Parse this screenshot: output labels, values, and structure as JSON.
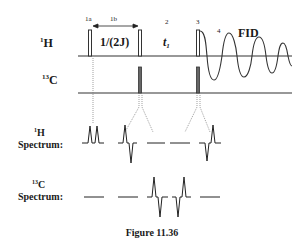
{
  "figure": {
    "caption": "Figure 11.36",
    "channels": {
      "proton": {
        "label_sup": "1",
        "label_main": "H"
      },
      "carbon": {
        "label_sup": "13",
        "label_main": "C"
      }
    },
    "steps": {
      "s1a": "1a",
      "s1b": "1b",
      "s2": "2",
      "s3": "3",
      "s4": "4"
    },
    "delay_label": "1/(2J)",
    "evolution_label_main": "t",
    "evolution_label_sub": "1",
    "fid_label": "FID",
    "spectra": {
      "proton": {
        "sup": "1",
        "line1": "H",
        "line2": "Spectrum:"
      },
      "carbon": {
        "sup": "13",
        "line1": "C",
        "line2": "Spectrum:"
      }
    }
  }
}
